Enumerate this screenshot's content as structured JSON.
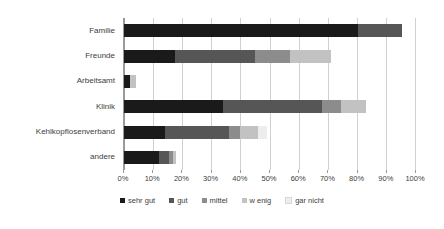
{
  "chart_data": {
    "type": "bar",
    "orientation": "horizontal",
    "stacked": true,
    "normalized": "percent",
    "title": "",
    "subtitle": "",
    "xlabel": "",
    "ylabel": "",
    "xlim": [
      0,
      100
    ],
    "ylim": null,
    "grid": true,
    "legend_position": "bottom",
    "categories": [
      "Familie",
      "Freunde",
      "Arbeitsamt",
      "Klinik",
      "Kehlkopflosenverband",
      "andere"
    ],
    "xticks": [
      0,
      10,
      20,
      30,
      40,
      50,
      60,
      70,
      80,
      90,
      100
    ],
    "xticklabels": [
      "0%",
      "10%",
      "20%",
      "30%",
      "40%",
      "50%",
      "60%",
      "70%",
      "80%",
      "90%",
      "100%"
    ],
    "series": [
      {
        "name": "sehr gut",
        "color": "#1a1a1a",
        "values": [
          80.5,
          17.5,
          2.0,
          34.0,
          14.0,
          12.0
        ]
      },
      {
        "name": "gut",
        "color": "#565656",
        "values": [
          15.0,
          27.5,
          0.0,
          34.0,
          22.0,
          3.5
        ]
      },
      {
        "name": "mittel",
        "color": "#8c8c8c",
        "values": [
          0.0,
          12.0,
          0.0,
          6.5,
          4.0,
          1.5
        ]
      },
      {
        "name": "w enig",
        "color": "#c2c2c2",
        "values": [
          0.0,
          14.0,
          2.0,
          8.5,
          6.0,
          1.0
        ]
      },
      {
        "name": "gar nicht",
        "color": "#ededed",
        "values": [
          0.0,
          0.0,
          0.0,
          0.0,
          3.0,
          0.0
        ]
      }
    ],
    "totals": [
      95.5,
      71.0,
      4.0,
      83.0,
      49.0,
      18.0
    ]
  },
  "legend": {
    "items": [
      {
        "label": "sehr gut",
        "color": "#1a1a1a"
      },
      {
        "label": "gut",
        "color": "#565656"
      },
      {
        "label": "mittel",
        "color": "#8c8c8c"
      },
      {
        "label": "w enig",
        "color": "#c2c2c2"
      },
      {
        "label": "gar nicht",
        "color": "#ededed"
      }
    ]
  },
  "style": {
    "plot_background": "#ffffff",
    "gridline_color": "#d0d0d0",
    "axis_color": "#9a9a9a",
    "text_color": "#404040"
  }
}
